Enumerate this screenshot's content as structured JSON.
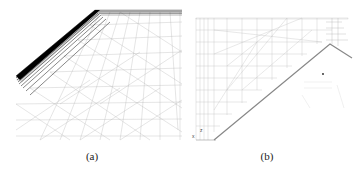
{
  "figure": {
    "panels": [
      {
        "id": "a",
        "caption": "(a)",
        "description": "3D perspective view of surface mesh with dense boundary-layer refinement along angled edge"
      },
      {
        "id": "b",
        "caption": "(b)",
        "description": "2D cross-section mesh with diagonal wall and structured/unstructured regions"
      }
    ],
    "axis_indicator": {
      "labels": [
        "z",
        "x"
      ]
    },
    "colors": {
      "mesh_line": "#9a9a9a",
      "dense_edge": "#111111",
      "background": "#ffffff"
    }
  }
}
